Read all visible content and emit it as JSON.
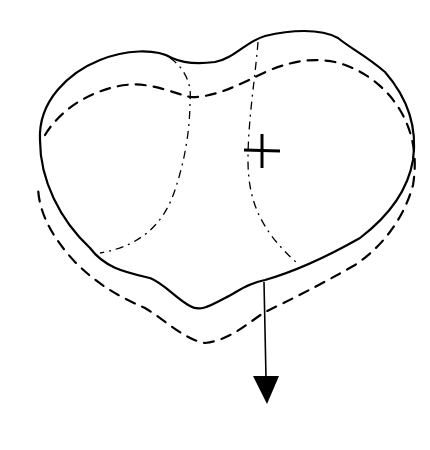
{
  "figure": {
    "colors": {
      "stroke": "#000000",
      "background": "#ffffff"
    },
    "elements": [
      {
        "name": "outer-solid-outline",
        "style": "solid"
      },
      {
        "name": "offset-dashed-outline",
        "style": "dashed"
      },
      {
        "name": "left-dash-dot-region",
        "style": "dash-dot"
      },
      {
        "name": "right-dash-dot-region",
        "style": "dash-dot"
      },
      {
        "name": "centroid-cross",
        "symbol": "+"
      },
      {
        "name": "load-arrow",
        "direction": "down"
      }
    ]
  }
}
